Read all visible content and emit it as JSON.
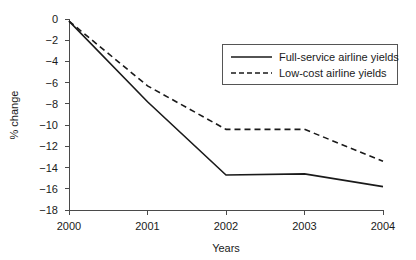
{
  "chart_data": {
    "type": "line",
    "title": "",
    "xlabel": "Years",
    "ylabel": "% change",
    "categories": [
      "2000",
      "2001",
      "2002",
      "2003",
      "2004"
    ],
    "x": [
      2000,
      2001,
      2002,
      2003,
      2004
    ],
    "xlim": [
      2000,
      2004
    ],
    "ylim": [
      -18,
      0
    ],
    "yticks": [
      0,
      -2,
      -4,
      -6,
      -8,
      -10,
      -12,
      -14,
      -16,
      -18
    ],
    "ytick_labels": [
      "0",
      "-2",
      "-4",
      "-6",
      "-8",
      "-10",
      "-12",
      "-14",
      "-16",
      "-18"
    ],
    "xtick_labels": [
      "2000",
      "2001",
      "2002",
      "2003",
      "2004"
    ],
    "grid": false,
    "legend_position": "upper right",
    "series": [
      {
        "name": "Full-service airline yields",
        "style": "solid",
        "color": "#1a1a1a",
        "values": [
          -0.2,
          -7.8,
          -14.7,
          -14.6,
          -15.8
        ]
      },
      {
        "name": "Low-cost airline yields",
        "style": "dashed",
        "color": "#1a1a1a",
        "values": [
          -0.2,
          -6.3,
          -10.4,
          -10.4,
          -13.4
        ]
      }
    ]
  },
  "axes": {
    "y_title": "% change",
    "x_title": "Years"
  },
  "legend": {
    "items": [
      {
        "label": "Full-service airline yields",
        "style": "solid"
      },
      {
        "label": "Low-cost airline yields",
        "style": "dashed"
      }
    ]
  }
}
